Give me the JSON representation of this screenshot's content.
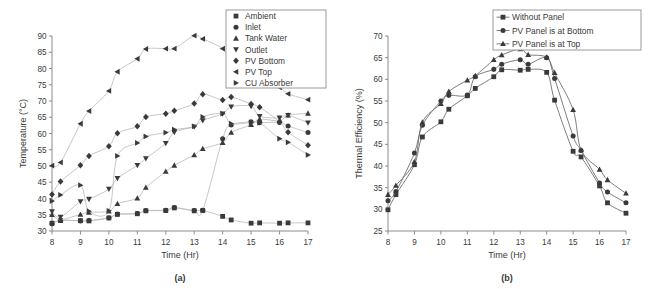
{
  "figure": {
    "panel_a_caption": "(a)",
    "panel_b_caption": "(b)"
  },
  "chart_data": [
    {
      "type": "scatter",
      "panel": "(a)",
      "title": "",
      "xlabel": "Time (Hr)",
      "ylabel": "Temperature (°C)",
      "xlim": [
        8,
        17
      ],
      "ylim": [
        30,
        90
      ],
      "xticks": [
        8,
        9,
        10,
        11,
        12,
        13,
        14,
        15,
        16,
        17
      ],
      "yticks": [
        30,
        35,
        40,
        45,
        50,
        55,
        60,
        65,
        70,
        75,
        80,
        85,
        90
      ],
      "grid": false,
      "legend_position": "top-right",
      "legend": [
        "Ambient",
        "Inlet",
        "Tank Water",
        "Outlet",
        "PV Bottom",
        "PV Top",
        "CU Absorber"
      ],
      "series": [
        {
          "name": "Ambient",
          "marker": "square",
          "x": [
            8.0,
            8.3,
            9.0,
            9.3,
            10.0,
            10.3,
            11.0,
            11.3,
            12.0,
            12.3,
            13.0,
            13.3,
            14.0,
            14.3,
            15.0,
            15.3,
            16.0,
            16.3,
            17.0
          ],
          "y": [
            32.4,
            33.2,
            33.2,
            33.1,
            34.0,
            35.1,
            35.3,
            36.2,
            36.3,
            37.1,
            36.2,
            36.3,
            34.5,
            33.4,
            32.4,
            32.5,
            32.4,
            32.5,
            32.5
          ]
        },
        {
          "name": "Inlet",
          "marker": "circle",
          "x": [
            8.0,
            8.3,
            9.0,
            9.3,
            10.0,
            10.3,
            11.0,
            11.3,
            12.0,
            12.3,
            13.0,
            13.3,
            14.0,
            14.3,
            15.0,
            15.3,
            16.0,
            16.3,
            17.0
          ],
          "y": [
            32.2,
            33.3,
            33.1,
            33.2,
            34.1,
            35.2,
            35.4,
            36.3,
            36.4,
            37.2,
            36.3,
            36.4,
            58.4,
            62.6,
            63.6,
            63.3,
            63.4,
            62.3,
            60.3
          ]
        },
        {
          "name": "Tank Water",
          "marker": "triangle-up",
          "x": [
            8.0,
            8.3,
            9.0,
            9.3,
            10.0,
            10.3,
            11.0,
            11.3,
            12.0,
            12.3,
            13.0,
            13.3,
            14.0,
            14.3,
            15.0,
            15.3,
            16.0,
            16.3,
            17.0
          ],
          "y": [
            35.0,
            33.5,
            35.1,
            35.7,
            36.1,
            38.4,
            40.1,
            43.4,
            48.3,
            50.2,
            53.4,
            55.3,
            57.2,
            60.3,
            62.7,
            64.4,
            63.9,
            65.6,
            66.2
          ]
        },
        {
          "name": "Outlet",
          "marker": "triangle-down",
          "x": [
            8.0,
            8.3,
            9.0,
            9.3,
            10.0,
            10.3,
            11.0,
            11.3,
            12.0,
            12.3,
            13.0,
            13.3,
            14.0,
            14.3,
            15.0,
            15.3,
            16.0,
            16.3,
            17.0
          ],
          "y": [
            36.0,
            34.3,
            39.1,
            39.8,
            42.9,
            46.2,
            50.2,
            52.3,
            57.0,
            60.4,
            62.1,
            64.0,
            66.1,
            68.2,
            68.4,
            65.3,
            64.8,
            65.6,
            63.3
          ]
        },
        {
          "name": "PV Bottom",
          "marker": "diamond",
          "x": [
            8.0,
            8.3,
            9.0,
            9.3,
            10.0,
            10.3,
            11.0,
            11.3,
            12.0,
            12.3,
            13.0,
            13.3,
            14.0,
            14.3,
            15.0,
            15.3,
            16.0,
            16.3,
            17.0
          ],
          "y": [
            41.2,
            45.2,
            50.2,
            53.1,
            56.1,
            60.1,
            62.2,
            65.1,
            66.1,
            67.0,
            69.2,
            72.1,
            70.3,
            71.2,
            69.1,
            68.1,
            63.6,
            60.4,
            56.4
          ]
        },
        {
          "name": "PV Top",
          "marker": "triangle-left",
          "x": [
            8.0,
            8.3,
            9.0,
            9.3,
            10.0,
            10.3,
            11.0,
            11.3,
            12.0,
            12.3,
            13.0,
            13.3,
            14.0,
            14.3,
            15.0,
            15.3,
            16.0,
            16.3,
            17.0
          ],
          "y": [
            50.1,
            51.1,
            63.0,
            66.9,
            73.1,
            79.0,
            83.0,
            86.0,
            86.1,
            86.1,
            90.1,
            89.1,
            86.1,
            82.0,
            78.4,
            76.3,
            74.2,
            72.2,
            70.4
          ]
        },
        {
          "name": "CU Absorber",
          "marker": "triangle-right",
          "x": [
            8.0,
            8.3,
            9.0,
            9.3,
            10.0,
            10.3,
            11.0,
            11.3,
            12.0,
            12.3,
            13.0,
            13.3,
            14.0,
            14.3,
            15.0,
            15.3,
            16.0,
            16.3,
            17.0
          ],
          "y": [
            39.2,
            41.1,
            44.1,
            36.1,
            36.2,
            53.1,
            57.1,
            59.1,
            60.3,
            61.2,
            62.2,
            65.1,
            66.1,
            63.0,
            63.4,
            63.3,
            58.4,
            57.3,
            53.4
          ]
        }
      ]
    },
    {
      "type": "line",
      "panel": "(b)",
      "title": "",
      "xlabel": "Time (Hr)",
      "ylabel": "Thermal Efficiency (%)",
      "xlim": [
        8,
        17
      ],
      "ylim": [
        25,
        70
      ],
      "xticks": [
        8,
        9,
        10,
        11,
        12,
        13,
        14,
        15,
        16,
        17
      ],
      "yticks": [
        25,
        30,
        35,
        40,
        45,
        50,
        55,
        60,
        65,
        70
      ],
      "grid": false,
      "legend_position": "top-right",
      "legend": [
        "Without Panel",
        "PV Panel is at Bottom",
        "PV Panel is at Top"
      ],
      "series": [
        {
          "name": "Without Panel",
          "marker": "square",
          "x": [
            8.0,
            8.3,
            9.0,
            9.3,
            10.0,
            10.3,
            11.0,
            11.3,
            12.0,
            12.3,
            13.0,
            13.3,
            14.0,
            14.3,
            15.0,
            15.3,
            16.0,
            16.3,
            17.0
          ],
          "y": [
            29.9,
            33.4,
            40.3,
            46.7,
            50.2,
            53.1,
            56.2,
            57.9,
            60.6,
            62.2,
            62.1,
            62.3,
            61.6,
            55.2,
            43.4,
            42.1,
            35.4,
            31.5,
            29.1
          ]
        },
        {
          "name": "PV Panel is at Bottom",
          "marker": "circle",
          "x": [
            8.0,
            8.3,
            9.0,
            9.3,
            10.0,
            10.3,
            11.0,
            11.3,
            12.0,
            12.3,
            13.0,
            13.3,
            14.0,
            14.3,
            15.0,
            15.3,
            16.0,
            16.3,
            17.0
          ],
          "y": [
            32.0,
            34.1,
            43.0,
            49.4,
            55.0,
            56.3,
            56.4,
            60.6,
            62.3,
            63.5,
            64.5,
            63.5,
            65.0,
            60.2,
            46.9,
            43.6,
            36.1,
            34.0,
            31.5
          ]
        },
        {
          "name": "PV Panel is at Top",
          "marker": "triangle-up",
          "x": [
            8.0,
            8.3,
            9.0,
            9.3,
            10.0,
            10.3,
            11.0,
            11.3,
            12.0,
            12.3,
            13.0,
            13.3,
            14.0,
            14.3,
            15.0,
            15.3,
            16.0,
            16.3,
            17.0
          ],
          "y": [
            33.4,
            35.5,
            41.0,
            50.1,
            54.4,
            57.2,
            59.8,
            60.8,
            64.5,
            65.6,
            67.0,
            65.7,
            65.1,
            61.5,
            53.0,
            43.7,
            39.2,
            36.8,
            33.7
          ]
        }
      ]
    }
  ]
}
